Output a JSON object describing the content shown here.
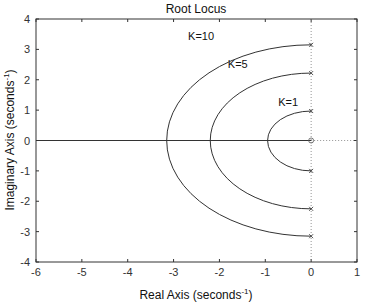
{
  "chart_data": {
    "type": "line",
    "title": "Root Locus",
    "xlabel": "Real Axis (seconds",
    "xlabel_sup": "-1",
    "ylabel": "Imaginary Axis (seconds",
    "ylabel_sup": "-1",
    "xlim": [
      -6,
      1
    ],
    "ylim": [
      -4,
      4
    ],
    "xticks": [
      -6,
      -5,
      -4,
      -3,
      -2,
      -1,
      0,
      1
    ],
    "yticks": [
      -4,
      -3,
      -2,
      -1,
      0,
      1,
      2,
      3,
      4
    ],
    "grid": false,
    "series": [
      {
        "name": "K=1",
        "label": "K=1",
        "shape": "semicircle",
        "real_axis_crossing": -0.95,
        "imag_extent": 0.97,
        "poles": [
          [
            0,
            0.97
          ],
          [
            0,
            -1.0
          ]
        ]
      },
      {
        "name": "K=5",
        "label": "K=5",
        "shape": "semicircle",
        "real_axis_crossing": -2.2,
        "imag_extent": 2.25,
        "poles": [
          [
            0,
            2.22
          ],
          [
            0,
            -2.25
          ]
        ]
      },
      {
        "name": "K=10",
        "label": "K=10",
        "shape": "semicircle",
        "real_axis_crossing": -3.15,
        "imag_extent": 3.15,
        "poles": [
          [
            0,
            3.15
          ],
          [
            0,
            -3.15
          ]
        ]
      }
    ],
    "real_axis_line": true,
    "zero_marker": [
      0,
      0
    ],
    "dotted_lines": [
      "x=0 vertical",
      "y=0 for x>0"
    ]
  }
}
